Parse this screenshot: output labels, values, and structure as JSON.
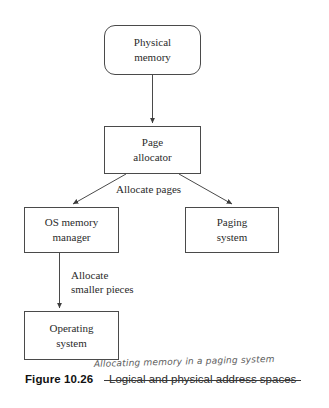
{
  "figure": {
    "number_label": "Figure 10.26",
    "printed_caption": "Logical and physical address spaces",
    "printed_caption_struck_through": true,
    "handwritten_correction": "Allocating memory in a paging system"
  },
  "diagram": {
    "type": "flowchart",
    "orientation": "top-down",
    "background_color": "#ffffff",
    "stroke_color": "#4a4a4a",
    "text_color": "#2b2b2b",
    "nodes": [
      {
        "id": "physical-memory",
        "lines": [
          "Physical",
          "memory"
        ],
        "shape": "rounded-rectangle"
      },
      {
        "id": "page-allocator",
        "lines": [
          "Page",
          "allocator"
        ],
        "shape": "rectangle"
      },
      {
        "id": "os-memory-manager",
        "lines": [
          "OS memory",
          "manager"
        ],
        "shape": "rectangle"
      },
      {
        "id": "paging-system",
        "lines": [
          "Paging",
          "system"
        ],
        "shape": "rectangle"
      },
      {
        "id": "operating-system",
        "lines": [
          "Operating",
          "system"
        ],
        "shape": "rectangle"
      }
    ],
    "edges": [
      {
        "id": "physical-memory-to-page-allocator",
        "from": "physical-memory",
        "to": "page-allocator",
        "label": "",
        "arrowhead": true
      },
      {
        "id": "page-allocator-to-os-memory-manager",
        "from": "page-allocator",
        "to": "os-memory-manager",
        "label": "Allocate pages",
        "arrowhead": true
      },
      {
        "id": "page-allocator-to-paging-system",
        "from": "page-allocator",
        "to": "paging-system",
        "label": "Allocate pages",
        "arrowhead": true
      },
      {
        "id": "os-memory-manager-to-operating-system",
        "from": "os-memory-manager",
        "to": "operating-system",
        "label_lines": [
          "Allocate",
          "smaller pieces"
        ],
        "arrowhead": true
      }
    ],
    "edge_labels": {
      "allocate_pages": "Allocate pages",
      "allocate_smaller_pieces_line1": "Allocate",
      "allocate_smaller_pieces_line2": "smaller pieces"
    }
  }
}
